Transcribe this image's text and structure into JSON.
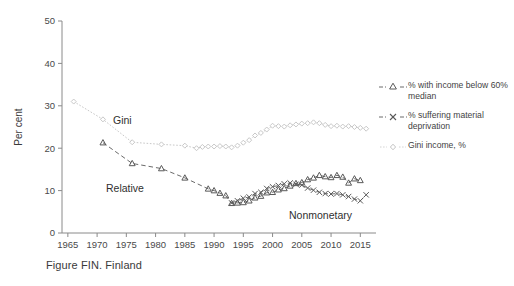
{
  "caption": "Figure FIN. Finland",
  "colors": {
    "axis": "#8a8a8a",
    "tick_text": "#4a4a4a",
    "relative": "#595959",
    "nonmonetary": "#5a5a5a",
    "gini": "#c8c8c8",
    "background": "#ffffff"
  },
  "legend": {
    "items": [
      {
        "key": "triangle-dashed-marker",
        "label": "% with income below 60% median"
      },
      {
        "key": "cross-dashed-marker",
        "label": "% suffering material deprivation"
      },
      {
        "key": "diamond-dotted-marker",
        "label": "Gini income, %"
      }
    ]
  },
  "inplot_labels": [
    {
      "name": "gini-label",
      "text": "Gini",
      "x": 113,
      "y": 124
    },
    {
      "name": "relative-label",
      "text": "Relative",
      "x": 106,
      "y": 192
    },
    {
      "name": "nonmonetary-label",
      "text": "Nonmonetary",
      "x": 289,
      "y": 219
    }
  ],
  "chart_data": {
    "type": "line",
    "title": "",
    "xlabel": "",
    "ylabel": "Per cent",
    "xlim": [
      1964,
      2017
    ],
    "ylim": [
      0,
      50
    ],
    "yticks": [
      0,
      10,
      20,
      30,
      40,
      50
    ],
    "xticks": [
      1965,
      1970,
      1975,
      1980,
      1985,
      1990,
      1995,
      2000,
      2005,
      2010,
      2015
    ],
    "grid": false,
    "legend_position": "right",
    "series": [
      {
        "name": "Gini income, %",
        "marker": "diamond",
        "linestyle": "dotted",
        "color": "#c8c8c8",
        "points": [
          [
            1966,
            31.0
          ],
          [
            1971,
            26.8
          ],
          [
            1976,
            21.4
          ],
          [
            1981,
            20.9
          ],
          [
            1985,
            20.6
          ],
          [
            1987,
            20.0
          ],
          [
            1988,
            20.3
          ],
          [
            1989,
            20.4
          ],
          [
            1990,
            20.4
          ],
          [
            1991,
            20.5
          ],
          [
            1992,
            20.4
          ],
          [
            1993,
            20.2
          ],
          [
            1994,
            20.6
          ],
          [
            1995,
            21.3
          ],
          [
            1996,
            21.9
          ],
          [
            1997,
            23.0
          ],
          [
            1998,
            23.6
          ],
          [
            1999,
            24.4
          ],
          [
            2000,
            25.3
          ],
          [
            2001,
            25.2
          ],
          [
            2002,
            25.1
          ],
          [
            2003,
            25.4
          ],
          [
            2004,
            25.6
          ],
          [
            2005,
            25.8
          ],
          [
            2006,
            25.9
          ],
          [
            2007,
            26.1
          ],
          [
            2008,
            25.9
          ],
          [
            2009,
            25.5
          ],
          [
            2010,
            25.2
          ],
          [
            2011,
            25.3
          ],
          [
            2012,
            25.1
          ],
          [
            2013,
            25.2
          ],
          [
            2014,
            25.0
          ],
          [
            2015,
            24.8
          ],
          [
            2016,
            24.6
          ]
        ]
      },
      {
        "name": "% with income below 60% median",
        "marker": "triangle",
        "linestyle": "dashed",
        "color": "#595959",
        "points": [
          [
            1971,
            21.3
          ],
          [
            1976,
            16.4
          ],
          [
            1981,
            15.2
          ],
          [
            1985,
            13.0
          ],
          [
            1989,
            10.4
          ],
          [
            1990,
            10.0
          ],
          [
            1991,
            9.4
          ],
          [
            1992,
            8.8
          ],
          [
            1993,
            7.0
          ],
          [
            1994,
            7.1
          ],
          [
            1995,
            7.2
          ],
          [
            1996,
            7.6
          ],
          [
            1997,
            8.3
          ],
          [
            1998,
            8.7
          ],
          [
            1999,
            9.5
          ],
          [
            2000,
            9.6
          ],
          [
            2001,
            10.2
          ],
          [
            2002,
            10.5
          ],
          [
            2003,
            11.1
          ],
          [
            2004,
            11.7
          ],
          [
            2005,
            11.9
          ],
          [
            2006,
            12.6
          ],
          [
            2007,
            13.0
          ],
          [
            2008,
            13.6
          ],
          [
            2009,
            13.3
          ],
          [
            2010,
            13.1
          ],
          [
            2011,
            13.6
          ],
          [
            2012,
            13.2
          ],
          [
            2013,
            11.8
          ],
          [
            2014,
            12.8
          ],
          [
            2015,
            12.4
          ]
        ]
      },
      {
        "name": "% suffering material deprivation",
        "marker": "cross",
        "linestyle": "dashed",
        "color": "#5a5a5a",
        "points": [
          [
            1993,
            7.1
          ],
          [
            1994,
            7.6
          ],
          [
            1995,
            8.2
          ],
          [
            1996,
            8.5
          ],
          [
            1997,
            9.3
          ],
          [
            1998,
            9.6
          ],
          [
            1999,
            10.5
          ],
          [
            2000,
            10.9
          ],
          [
            2001,
            11.2
          ],
          [
            2002,
            11.6
          ],
          [
            2003,
            11.8
          ],
          [
            2004,
            11.5
          ],
          [
            2005,
            11.3
          ],
          [
            2006,
            10.6
          ],
          [
            2007,
            10.1
          ],
          [
            2008,
            9.6
          ],
          [
            2009,
            9.3
          ],
          [
            2010,
            9.2
          ],
          [
            2011,
            9.3
          ],
          [
            2012,
            9.0
          ],
          [
            2013,
            8.6
          ],
          [
            2014,
            8.0
          ],
          [
            2015,
            7.6
          ],
          [
            2016,
            9.0
          ]
        ]
      }
    ]
  }
}
